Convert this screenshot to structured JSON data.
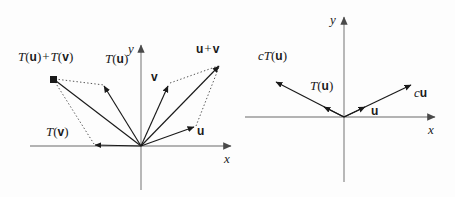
{
  "figure": {
    "background_color": "#fdfdfd",
    "axis_color": "#9a9a9a",
    "vector_color": "#1a1a1a",
    "dotted_color": "#555555",
    "width": 455,
    "height": 197
  },
  "left_panel": {
    "name": "additivity-panel",
    "caption": "T(u) + T(v) = T(u + v)",
    "origin": {
      "x": 141,
      "y": 146
    },
    "axes": {
      "x_label": "x",
      "y_label": "y",
      "x_start": {
        "x": 30,
        "y": 146
      },
      "x_end": {
        "x": 233,
        "y": 146
      },
      "y_start": {
        "x": 141,
        "y": 190
      },
      "y_end": {
        "x": 141,
        "y": 43
      }
    },
    "vectors": [
      {
        "name": "T(u) + T(v)",
        "label_parts": [
          "T",
          "(",
          "u",
          ")",
          "+",
          "T",
          "(",
          "v",
          ")"
        ],
        "tip": {
          "x": 53,
          "y": 80
        },
        "label_pos": {
          "x": 18,
          "y": 57
        },
        "marker": "filled-square"
      },
      {
        "name": "T(u)",
        "label_parts": [
          "T",
          "(",
          "u",
          ")"
        ],
        "tip": {
          "x": 104,
          "y": 85
        },
        "label_pos": {
          "x": 104,
          "y": 58
        },
        "marker": "arrow"
      },
      {
        "name": "T(v)",
        "label_parts": [
          "T",
          "(",
          "v",
          ")"
        ],
        "tip": {
          "x": 94,
          "y": 145
        },
        "label_pos": {
          "x": 46,
          "y": 131
        },
        "marker": "arrow"
      },
      {
        "name": "v",
        "label_parts": [
          "v"
        ],
        "tip": {
          "x": 168,
          "y": 84
        },
        "label_pos": {
          "x": 152,
          "y": 76
        },
        "marker": "arrow"
      },
      {
        "name": "u",
        "label_parts": [
          "u"
        ],
        "tip": {
          "x": 195,
          "y": 128
        },
        "label_pos": {
          "x": 198,
          "y": 130
        },
        "marker": "arrow"
      },
      {
        "name": "u + v",
        "label_parts": [
          "u",
          "+",
          "v"
        ],
        "tip": {
          "x": 220,
          "y": 64
        },
        "label_pos": {
          "x": 196,
          "y": 48
        },
        "marker": "arrow"
      }
    ],
    "dotted_connectors": [
      {
        "from": "T(u)+T(v)",
        "to": "T(u)"
      },
      {
        "from": "T(u)+T(v)",
        "to": "T(v)"
      },
      {
        "from": "v",
        "to": "u+v"
      },
      {
        "from": "u",
        "to": "u+v"
      }
    ]
  },
  "right_panel": {
    "name": "homogeneity-panel",
    "caption": "cT(u) = T(cu)",
    "origin": {
      "x": 344,
      "y": 117
    },
    "axes": {
      "x_label": "x",
      "y_label": "y",
      "x_start": {
        "x": 245,
        "y": 117
      },
      "x_end": {
        "x": 437,
        "y": 117
      },
      "y_start": {
        "x": 344,
        "y": 182
      },
      "y_end": {
        "x": 344,
        "y": 15
      }
    },
    "vectors": [
      {
        "name": "cT(u)",
        "label_parts": [
          "c",
          "T",
          "(",
          "u",
          ")"
        ],
        "tip": {
          "x": 274,
          "y": 80
        },
        "label_pos": {
          "x": 259,
          "y": 55
        },
        "marker": "arrow"
      },
      {
        "name": "T(u)",
        "label_parts": [
          "T",
          "(",
          "u",
          ")"
        ],
        "tip": {
          "x": 323,
          "y": 108
        },
        "label_pos": {
          "x": 311,
          "y": 86
        },
        "marker": "arrow"
      },
      {
        "name": "u",
        "label_parts": [
          "u"
        ],
        "tip": {
          "x": 366,
          "y": 106
        },
        "label_pos": {
          "x": 372,
          "y": 105
        },
        "marker": "arrow"
      },
      {
        "name": "cu",
        "label_parts": [
          "c",
          "u"
        ],
        "tip": {
          "x": 413,
          "y": 84
        },
        "label_pos": {
          "x": 415,
          "y": 87
        },
        "marker": "arrow"
      }
    ]
  },
  "labels": {
    "T": "T",
    "c": "c",
    "u": "u",
    "v": "v",
    "plus": "+",
    "open_paren": "(",
    "close_paren": ")",
    "x_axis": "x",
    "y_axis": "y"
  }
}
